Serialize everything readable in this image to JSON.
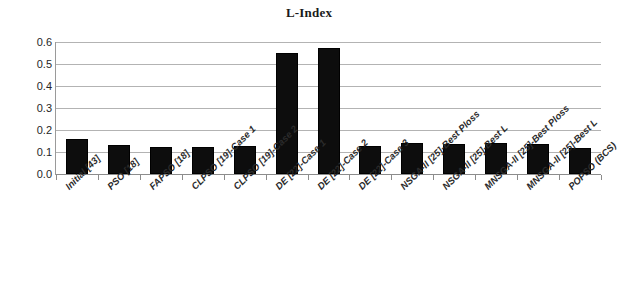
{
  "chart_data": {
    "type": "bar",
    "title": "L-Index",
    "xlabel": "",
    "ylabel": "",
    "ylim": [
      0.0,
      0.6
    ],
    "yticks": [
      "0.0",
      "0.1",
      "0.2",
      "0.3",
      "0.4",
      "0.5",
      "0.6"
    ],
    "ytick_values": [
      0.0,
      0.1,
      0.2,
      0.3,
      0.4,
      0.5,
      0.6
    ],
    "grid": true,
    "legend": "none",
    "bar_color": "#0d0d0d",
    "categories": [
      "Initial [43]",
      "PSO [18]",
      "FAPSO [18]",
      "CLPSO [19]-Case 1",
      "CLPSO [19]-Case 2",
      "DE [22]-Case 1",
      "DE [22]-Case 2",
      "DE [22]-Case 3",
      "NSGA-II [25]-Best Ploss",
      "NSGA-II [25]-Best L",
      "MNSGA-II [25]-Best Ploss",
      "MNSGA-II [25]-Best L",
      "POPSO (BCS)"
    ],
    "values": [
      0.157,
      0.132,
      0.125,
      0.123,
      0.126,
      0.551,
      0.575,
      0.126,
      0.14,
      0.138,
      0.14,
      0.138,
      0.118
    ]
  }
}
